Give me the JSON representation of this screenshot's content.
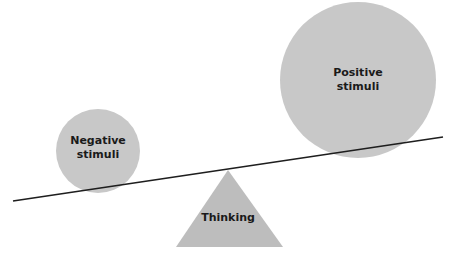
{
  "diagram": {
    "negative": {
      "label_line1": "Negative",
      "label_line2": "stimuli",
      "color": "#c8c8c8"
    },
    "positive": {
      "label_line1": "Positive",
      "label_line2": "stimuli",
      "color": "#c8c8c8"
    },
    "fulcrum": {
      "label": "Thinking",
      "color": "#bdbdbd"
    },
    "beam": {
      "color": "#1e1e1e"
    }
  }
}
